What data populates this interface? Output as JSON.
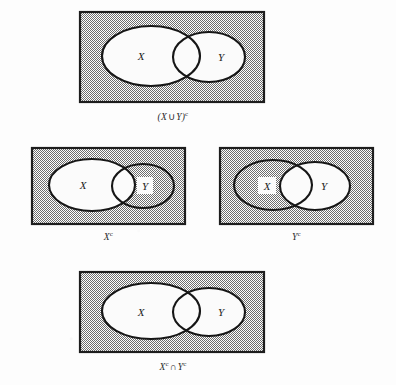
{
  "figure": {
    "title_text": "",
    "background_color": "#fdfdfd",
    "shade_color": "#9a9a9a",
    "outline_color": "#1a1a1a",
    "fill_color": "#ffffff",
    "illustrates": "De Morgan's law for set complements"
  },
  "panels": [
    {
      "id": "panel-union-complement",
      "caption_x": "X",
      "caption_op": "∪",
      "caption_y": "Y",
      "caption_full": "(X∪Y)ᶜ",
      "caption_sup": "c",
      "caption_open": "(",
      "caption_close": ")",
      "label_x": "X",
      "label_y": "Y",
      "label_x_boxed": false,
      "label_y_boxed": false,
      "shaded_regions": "universe outside X and Y",
      "x_ellipse_shaded": false,
      "y_ellipse_shaded": false,
      "rect_shaded": true
    },
    {
      "id": "panel-x-complement",
      "caption_full": "Xᶜ",
      "caption_main": "X",
      "caption_sup": "c",
      "label_x": "X",
      "label_y": "Y",
      "label_x_boxed": false,
      "label_y_boxed": true,
      "shaded_regions": "everything outside X, including Y minus X",
      "x_ellipse_shaded": false,
      "y_ellipse_shaded": true,
      "rect_shaded": true
    },
    {
      "id": "panel-y-complement",
      "caption_full": "Yᶜ",
      "caption_main": "Y",
      "caption_sup": "c",
      "label_x": "X",
      "label_y": "Y",
      "label_x_boxed": true,
      "label_y_boxed": false,
      "shaded_regions": "everything outside Y, including X minus Y",
      "x_ellipse_shaded": true,
      "y_ellipse_shaded": false,
      "rect_shaded": true
    },
    {
      "id": "panel-intersection-of-complements",
      "caption_full": "Xᶜ ∩ Yᶜ",
      "caption_left": "X",
      "caption_left_sup": "c",
      "caption_op": "∩",
      "caption_right": "Y",
      "caption_right_sup": "c",
      "label_x": "X",
      "label_y": "Y",
      "label_x_boxed": false,
      "label_y_boxed": false,
      "shaded_regions": "universe outside X and Y",
      "x_ellipse_shaded": false,
      "y_ellipse_shaded": false,
      "rect_shaded": true
    }
  ]
}
